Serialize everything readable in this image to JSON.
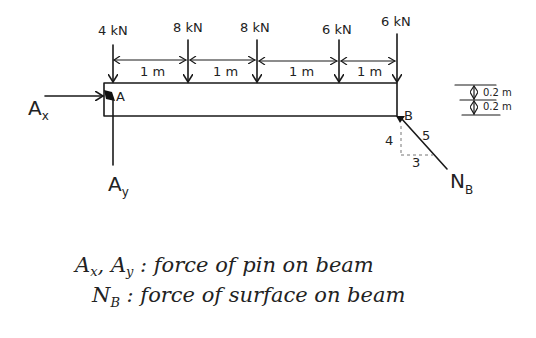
{
  "diagram": {
    "loads": [
      {
        "label": "4 kN",
        "value_kN": 4
      },
      {
        "label": "8 kN",
        "value_kN": 8
      },
      {
        "label": "8 kN",
        "value_kN": 8
      },
      {
        "label": "6 kN",
        "value_kN": 6
      },
      {
        "label": "6 kN",
        "value_kN": 6
      }
    ],
    "spans": [
      "1 m",
      "1 m",
      "1 m",
      "1 m"
    ],
    "supports": {
      "left": {
        "label": "A",
        "reaction_x": "A",
        "reaction_x_sub": "x",
        "reaction_y": "A",
        "reaction_y_sub": "y"
      },
      "right": {
        "label": "B",
        "reaction": "N",
        "reaction_sub": "B",
        "slope_rise": "4",
        "slope_run": "3",
        "slope_hyp": "5"
      }
    },
    "thickness": [
      "0.2 m",
      "0.2 m"
    ],
    "notes": [
      {
        "symbol": "A",
        "symbol_sub": "x",
        "sep": ", ",
        "symbol2": "A",
        "symbol2_sub": "y",
        "text": " : force of pin on beam"
      },
      {
        "symbol": "N",
        "symbol_sub": "B",
        "text": " : force of surface on beam"
      }
    ]
  }
}
